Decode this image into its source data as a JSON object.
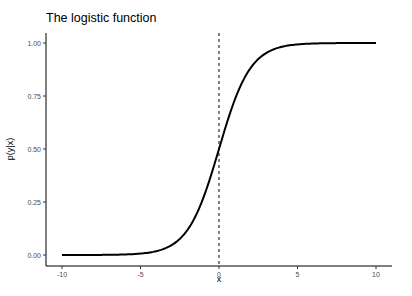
{
  "chart_data": {
    "type": "line",
    "title": "The logistic function",
    "xlabel": "x",
    "ylabel": "p(y|x)",
    "xlim": [
      -10,
      10
    ],
    "ylim": [
      0,
      1
    ],
    "x_ticks": [
      "-10",
      "-5",
      "0",
      "5",
      "10"
    ],
    "y_ticks": [
      "0.00",
      "0.25",
      "0.50",
      "0.75",
      "1.00"
    ],
    "grid": false,
    "legend": null,
    "series": [
      {
        "name": "logistic",
        "function": "p = 1 / (1 + exp(-x))",
        "x": [
          -10,
          -8,
          -6,
          -5,
          -4,
          -3,
          -2,
          -1,
          0,
          1,
          2,
          3,
          4,
          5,
          6,
          8,
          10
        ],
        "values": [
          0.0,
          0.0003,
          0.0025,
          0.0067,
          0.018,
          0.047,
          0.119,
          0.269,
          0.5,
          0.731,
          0.881,
          0.953,
          0.982,
          0.9933,
          0.9975,
          0.9997,
          1.0
        ]
      }
    ],
    "annotations": [
      {
        "type": "vline",
        "x": 0,
        "style": "dashed"
      }
    ]
  }
}
